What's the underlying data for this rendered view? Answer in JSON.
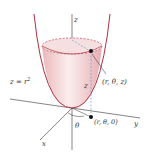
{
  "diagram": {
    "type": "cylindrical-coordinates-paraboloid",
    "surface_label": "z = r",
    "surface_label_exp": "2",
    "axes": {
      "z": "z",
      "y": "y",
      "x": "x"
    },
    "point_label": "(r, θ, z)",
    "projection_label": "(r, θ, 0)",
    "angle_label": "θ",
    "height_label": "z",
    "colors": {
      "surface_edge": "#b03040",
      "surface_fill": "#f2d4d6",
      "axis": "#333333",
      "dashed": "#5a9bd5"
    }
  }
}
